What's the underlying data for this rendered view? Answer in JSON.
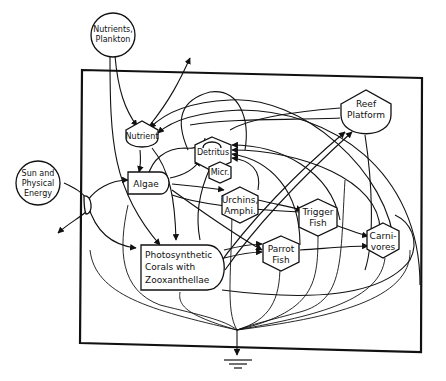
{
  "diagram": {
    "type": "energy-systems-diagram",
    "colors": {
      "ink": "#111111",
      "background": "#ffffff"
    },
    "external_sources": [
      {
        "id": "nutrients-plankton",
        "lines": [
          "Nutrients,",
          "Plankton"
        ],
        "shape": "circle"
      },
      {
        "id": "sun-energy",
        "lines": [
          "Sun and",
          "Physical",
          "Energy"
        ],
        "shape": "circle"
      }
    ],
    "storages": [
      {
        "id": "nutrient",
        "lines": [
          "Nutrient"
        ],
        "shape": "tank"
      },
      {
        "id": "reef-platform",
        "lines": [
          "Reef",
          "Platform"
        ],
        "shape": "tank"
      }
    ],
    "producers": [
      {
        "id": "algae",
        "lines": [
          "Algae"
        ],
        "shape": "bullet"
      },
      {
        "id": "corals",
        "lines": [
          "Photosynthetic",
          "Corals with",
          "Zooxanthellae"
        ],
        "shape": "bullet"
      }
    ],
    "consumers": [
      {
        "id": "detritus",
        "lines": [
          "Detritus"
        ],
        "shape": "hexagon"
      },
      {
        "id": "micr",
        "lines": [
          "Micr."
        ],
        "shape": "hexagon"
      },
      {
        "id": "urchins",
        "lines": [
          "Urchins,",
          "Amphi."
        ],
        "shape": "hexagon"
      },
      {
        "id": "trigger-fish",
        "lines": [
          "Trigger",
          "Fish"
        ],
        "shape": "hexagon"
      },
      {
        "id": "parrot-fish",
        "lines": [
          "Parrot",
          "Fish"
        ],
        "shape": "hexagon"
      },
      {
        "id": "carnivores",
        "lines": [
          "Carni-",
          "vores"
        ],
        "shape": "hexagon"
      }
    ],
    "sink": {
      "id": "heat-sink",
      "shape": "ground"
    }
  }
}
